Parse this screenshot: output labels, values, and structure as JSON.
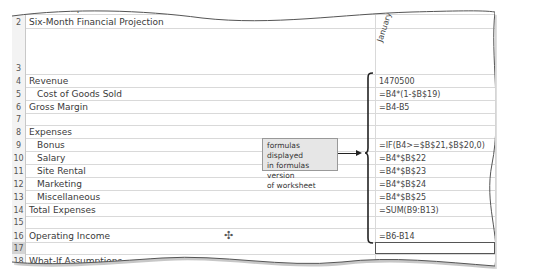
{
  "spreadsheet": {
    "column_header_b": "January",
    "rows": [
      {
        "num": "1",
        "label": "Mahola Department...",
        "formula": ""
      },
      {
        "num": "2",
        "label": "Six-Month Financial Projection",
        "formula": ""
      },
      {
        "num": "3",
        "label": "",
        "formula": ""
      },
      {
        "num": "4",
        "label": "Revenue",
        "formula": "1470500"
      },
      {
        "num": "5",
        "label": "Cost of Goods Sold",
        "formula": "=B4*(1-$B$19)"
      },
      {
        "num": "6",
        "label": "Gross Margin",
        "formula": "=B4-B5"
      },
      {
        "num": "7",
        "label": "",
        "formula": ""
      },
      {
        "num": "8",
        "label": "Expenses",
        "formula": ""
      },
      {
        "num": "9",
        "label": "Bonus",
        "formula": "=IF(B4>=$B$21,$B$20,0)"
      },
      {
        "num": "10",
        "label": "Salary",
        "formula": "=B4*$B$22"
      },
      {
        "num": "11",
        "label": "Site Rental",
        "formula": "=B4*$B$23"
      },
      {
        "num": "12",
        "label": "Marketing",
        "formula": "=B4*$B$24"
      },
      {
        "num": "13",
        "label": "Miscellaneous",
        "formula": "=B4*$B$25"
      },
      {
        "num": "14",
        "label": "Total Expenses",
        "formula": "=SUM(B9:B13)"
      },
      {
        "num": "15",
        "label": "",
        "formula": ""
      },
      {
        "num": "16",
        "label": "Operating Income",
        "formula": "=B6-B14"
      },
      {
        "num": "17",
        "label": "",
        "formula": ""
      },
      {
        "num": "18",
        "label": "What-If Assumptions",
        "formula": ""
      }
    ]
  },
  "callout": {
    "line1": "formulas displayed",
    "line2": "in formulas version",
    "line3": "of worksheet"
  },
  "icons": {
    "cursor": "cell-select-cursor-icon"
  }
}
